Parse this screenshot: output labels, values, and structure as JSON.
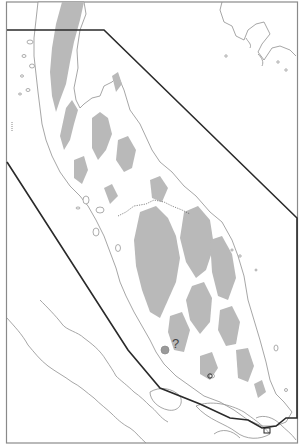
{
  "map": {
    "title": "",
    "marker_label": "?",
    "edge_label": "",
    "colors": {
      "background": "#ffffff",
      "coast": "#8f8f8f",
      "shaded_region": "#b9b9b9",
      "boundary": "#2a2a2a",
      "frame": "#8a8a8a"
    },
    "features": [
      {
        "name": "peninsula-coastline",
        "type": "outline"
      },
      {
        "name": "shaded-highland-regions",
        "type": "fill"
      },
      {
        "name": "study-area-boundary-polygon",
        "type": "line"
      },
      {
        "name": "southern-island-coast",
        "type": "outline"
      },
      {
        "name": "western-opposite-coast",
        "type": "outline"
      }
    ]
  }
}
